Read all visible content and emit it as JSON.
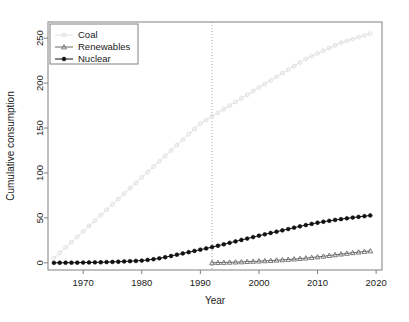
{
  "figure": {
    "background": "#ffffff",
    "caption": ""
  },
  "chart_data": {
    "type": "line",
    "title": "",
    "xlabel": "Year",
    "ylabel": "Cumulative consumption",
    "xlim": [
      1964,
      2021
    ],
    "ylim": [
      -8,
      268
    ],
    "xticks": [
      1970,
      1980,
      1990,
      2000,
      2010,
      2020
    ],
    "yticks": [
      0,
      50,
      100,
      150,
      200,
      250
    ],
    "grid": false,
    "legend_position": "top-left",
    "annotations": [
      {
        "name": "reference-line",
        "type": "vline",
        "x": 1992,
        "style": "dotted",
        "color": "#9a9a9a"
      }
    ],
    "x": [
      1965,
      1966,
      1967,
      1968,
      1969,
      1970,
      1971,
      1972,
      1973,
      1974,
      1975,
      1976,
      1977,
      1978,
      1979,
      1980,
      1981,
      1982,
      1983,
      1984,
      1985,
      1986,
      1987,
      1988,
      1989,
      1990,
      1991,
      1992,
      1993,
      1994,
      1995,
      1996,
      1997,
      1998,
      1999,
      2000,
      2001,
      2002,
      2003,
      2004,
      2005,
      2006,
      2007,
      2008,
      2009,
      2010,
      2011,
      2012,
      2013,
      2014,
      2015,
      2016,
      2017,
      2018,
      2019
    ],
    "series": [
      {
        "name": "Coal",
        "color": "#e0e0e0",
        "marker": "open-circle",
        "values": [
          5,
          11,
          17,
          23,
          29,
          35,
          41,
          47,
          53,
          59,
          65,
          71,
          77,
          83,
          89,
          95,
          101,
          107,
          113,
          119,
          125,
          131,
          137,
          143,
          149,
          155,
          159,
          163,
          167,
          171,
          175,
          179,
          183,
          187,
          191,
          195,
          199,
          203,
          207,
          211,
          215,
          219,
          223,
          227,
          230,
          233,
          236,
          239,
          242,
          245,
          247,
          249,
          251,
          253,
          255
        ]
      },
      {
        "name": "Renewables",
        "color": "#6b6b6b",
        "marker": "open-triangle",
        "start_year": 1992,
        "values": [
          null,
          null,
          null,
          null,
          null,
          null,
          null,
          null,
          null,
          null,
          null,
          null,
          null,
          null,
          null,
          null,
          null,
          null,
          null,
          null,
          null,
          null,
          null,
          null,
          null,
          null,
          null,
          0,
          0.2,
          0.4,
          0.6,
          0.8,
          1.0,
          1.3,
          1.6,
          1.9,
          2.2,
          2.5,
          2.9,
          3.3,
          3.7,
          4.2,
          4.7,
          5.3,
          5.9,
          6.6,
          7.3,
          8.1,
          8.9,
          9.7,
          10.5,
          11.2,
          11.9,
          12.6,
          13.2
        ]
      },
      {
        "name": "Nuclear",
        "color": "#111111",
        "marker": "filled-circle",
        "values": [
          0,
          0.05,
          0.1,
          0.15,
          0.2,
          0.3,
          0.4,
          0.5,
          0.6,
          0.8,
          1.0,
          1.2,
          1.5,
          1.8,
          2.1,
          2.5,
          3.2,
          4.0,
          5.0,
          6.2,
          7.6,
          9.0,
          10.4,
          11.8,
          13.2,
          14.6,
          16.0,
          17.5,
          19.0,
          20.6,
          22.2,
          23.8,
          25.4,
          27.0,
          28.6,
          30.2,
          31.7,
          33.2,
          34.6,
          36.1,
          37.6,
          39.1,
          40.6,
          42.0,
          43.3,
          44.6,
          45.7,
          46.7,
          47.7,
          48.6,
          49.5,
          50.3,
          51.1,
          51.9,
          52.7
        ]
      }
    ]
  },
  "legend": {
    "items": [
      {
        "label": "Coal",
        "marker": "open-circle",
        "color": "#e0e0e0"
      },
      {
        "label": "Renewables",
        "marker": "open-triangle",
        "color": "#6b6b6b"
      },
      {
        "label": "Nuclear",
        "marker": "filled-circle",
        "color": "#111111"
      }
    ]
  }
}
